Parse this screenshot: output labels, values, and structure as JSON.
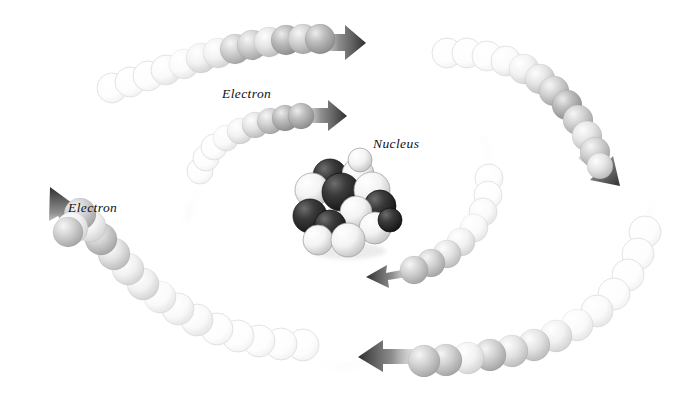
{
  "figure": {
    "background_color": "#ffffff",
    "width": 673,
    "height": 397
  },
  "labels": {
    "electron_outer_top": "Electron",
    "electron_outer_left": "Electron",
    "nucleus": "Nucleus"
  },
  "colors": {
    "background": "#ffffff",
    "arrow_dark": "#3a3a3a",
    "arrow_mid": "#6e6e6e",
    "sphere_dark": "#6a6a6a",
    "sphere_mid": "#a8a8a8",
    "sphere_light": "#e8e8e8",
    "sphere_faint": "#fbfbfb",
    "sphere_outline": "#cfcfcf",
    "proton_dark": "#2b2b2b",
    "neutron_light": "#f2f2f2",
    "wisp": "#e4e4e4",
    "text": "#111111"
  },
  "chart_data": {
    "type": "scatter",
    "xlabel": "",
    "ylabel": "",
    "xlim": [
      0,
      673
    ],
    "ylim": [
      0,
      397
    ],
    "grid": false,
    "legend": "none",
    "annotations": [
      {
        "text": "Electron",
        "x": 222,
        "y": 86,
        "style": "italic-serif"
      },
      {
        "text": "Electron",
        "x": 68,
        "y": 200,
        "style": "italic-serif"
      },
      {
        "text": "Nucleus",
        "x": 373,
        "y": 136,
        "style": "italic-serif"
      }
    ],
    "series": [
      {
        "name": "electron-trail-outer-top",
        "description": "Upper-left arc of spheres fading white-to-dark moving right",
        "arrow_direction": "right",
        "arrow_tip": [
          360,
          42
        ],
        "count": 13,
        "points": [
          {
            "x": 112,
            "y": 88,
            "r": 15,
            "shade": 0.03
          },
          {
            "x": 130,
            "y": 82,
            "r": 15,
            "shade": 0.04
          },
          {
            "x": 148,
            "y": 76,
            "r": 15,
            "shade": 0.05
          },
          {
            "x": 166,
            "y": 70,
            "r": 15,
            "shade": 0.08
          },
          {
            "x": 184,
            "y": 64,
            "r": 15,
            "shade": 0.13
          },
          {
            "x": 201,
            "y": 58,
            "r": 15,
            "shade": 0.22
          },
          {
            "x": 218,
            "y": 53,
            "r": 15,
            "shade": 0.35
          },
          {
            "x": 235,
            "y": 49,
            "r": 15,
            "shade": 0.5
          },
          {
            "x": 252,
            "y": 45,
            "r": 15,
            "shade": 0.62
          },
          {
            "x": 269,
            "y": 42,
            "r": 15,
            "shade": 0.45
          },
          {
            "x": 286,
            "y": 40,
            "r": 15,
            "shade": 0.7
          },
          {
            "x": 303,
            "y": 39,
            "r": 15,
            "shade": 0.55
          },
          {
            "x": 320,
            "y": 39,
            "r": 15,
            "shade": 0.74
          }
        ]
      },
      {
        "name": "electron-trail-inner",
        "description": "Inner small arc of spheres fading to dark moving right",
        "arrow_direction": "right",
        "arrow_tip": [
          343,
          114
        ],
        "count": 9,
        "points": [
          {
            "x": 200,
            "y": 171,
            "r": 13,
            "shade": 0.02
          },
          {
            "x": 206,
            "y": 158,
            "r": 13,
            "shade": 0.04
          },
          {
            "x": 214,
            "y": 147,
            "r": 13,
            "shade": 0.07
          },
          {
            "x": 226,
            "y": 138,
            "r": 13,
            "shade": 0.14
          },
          {
            "x": 240,
            "y": 131,
            "r": 13,
            "shade": 0.24
          },
          {
            "x": 255,
            "y": 125,
            "r": 13,
            "shade": 0.38
          },
          {
            "x": 270,
            "y": 121,
            "r": 13,
            "shade": 0.52
          },
          {
            "x": 285,
            "y": 118,
            "r": 13,
            "shade": 0.66
          },
          {
            "x": 301,
            "y": 116,
            "r": 13,
            "shade": 0.72
          }
        ]
      },
      {
        "name": "electron-trail-outer-right",
        "description": "Upper-right arc of spheres curving down, fading white-to-dark",
        "arrow_direction": "down-right",
        "arrow_tip": [
          637,
          190
        ],
        "count": 12,
        "points": [
          {
            "x": 447,
            "y": 53,
            "r": 15,
            "shade": 0.03
          },
          {
            "x": 467,
            "y": 53,
            "r": 15,
            "shade": 0.04
          },
          {
            "x": 487,
            "y": 56,
            "r": 15,
            "shade": 0.06
          },
          {
            "x": 506,
            "y": 61,
            "r": 15,
            "shade": 0.1
          },
          {
            "x": 524,
            "y": 69,
            "r": 15,
            "shade": 0.22
          },
          {
            "x": 540,
            "y": 79,
            "r": 15,
            "shade": 0.36
          },
          {
            "x": 554,
            "y": 91,
            "r": 15,
            "shade": 0.52
          },
          {
            "x": 567,
            "y": 105,
            "r": 15,
            "shade": 0.66
          },
          {
            "x": 578,
            "y": 120,
            "r": 15,
            "shade": 0.58
          },
          {
            "x": 587,
            "y": 136,
            "r": 15,
            "shade": 0.44
          },
          {
            "x": 595,
            "y": 152,
            "r": 15,
            "shade": 0.55
          },
          {
            "x": 600,
            "y": 166,
            "r": 13,
            "shade": 0.45
          }
        ]
      },
      {
        "name": "electron-trail-center-right",
        "description": "Short arc right of nucleus, sweeping left toward nucleus",
        "arrow_direction": "left",
        "arrow_tip": [
          375,
          276
        ],
        "count": 8,
        "points": [
          {
            "x": 489,
            "y": 178,
            "r": 14,
            "shade": 0.03
          },
          {
            "x": 488,
            "y": 195,
            "r": 14,
            "shade": 0.05
          },
          {
            "x": 483,
            "y": 212,
            "r": 14,
            "shade": 0.1
          },
          {
            "x": 474,
            "y": 228,
            "r": 14,
            "shade": 0.2
          },
          {
            "x": 461,
            "y": 242,
            "r": 14,
            "shade": 0.33
          },
          {
            "x": 447,
            "y": 254,
            "r": 14,
            "shade": 0.45
          },
          {
            "x": 431,
            "y": 263,
            "r": 14,
            "shade": 0.56
          },
          {
            "x": 414,
            "y": 270,
            "r": 14,
            "shade": 0.62
          }
        ]
      },
      {
        "name": "electron-trail-outer-bottom-right",
        "description": "Lower-right long arc sweeping left across the bottom",
        "arrow_direction": "left",
        "arrow_tip": [
          355,
          355
        ],
        "count": 13,
        "points": [
          {
            "x": 645,
            "y": 232,
            "r": 16,
            "shade": 0.03
          },
          {
            "x": 638,
            "y": 254,
            "r": 16,
            "shade": 0.04
          },
          {
            "x": 628,
            "y": 275,
            "r": 16,
            "shade": 0.05
          },
          {
            "x": 614,
            "y": 294,
            "r": 16,
            "shade": 0.07
          },
          {
            "x": 597,
            "y": 311,
            "r": 16,
            "shade": 0.1
          },
          {
            "x": 577,
            "y": 325,
            "r": 16,
            "shade": 0.18
          },
          {
            "x": 556,
            "y": 336,
            "r": 16,
            "shade": 0.3
          },
          {
            "x": 534,
            "y": 345,
            "r": 16,
            "shade": 0.44
          },
          {
            "x": 512,
            "y": 351,
            "r": 16,
            "shade": 0.36
          },
          {
            "x": 490,
            "y": 355,
            "r": 16,
            "shade": 0.6
          },
          {
            "x": 468,
            "y": 358,
            "r": 16,
            "shade": 0.3
          },
          {
            "x": 446,
            "y": 360,
            "r": 16,
            "shade": 0.52
          },
          {
            "x": 424,
            "y": 361,
            "r": 16,
            "shade": 0.55
          }
        ]
      },
      {
        "name": "electron-trail-outer-left",
        "description": "Lower-left long arc of spheres rising to an up arrow",
        "arrow_direction": "up",
        "arrow_tip": [
          52,
          192
        ],
        "count": 16,
        "points": [
          {
            "x": 303,
            "y": 345,
            "r": 16,
            "shade": 0.02
          },
          {
            "x": 281,
            "y": 344,
            "r": 16,
            "shade": 0.02
          },
          {
            "x": 259,
            "y": 341,
            "r": 16,
            "shade": 0.03
          },
          {
            "x": 238,
            "y": 336,
            "r": 16,
            "shade": 0.04
          },
          {
            "x": 217,
            "y": 329,
            "r": 16,
            "shade": 0.06
          },
          {
            "x": 197,
            "y": 320,
            "r": 16,
            "shade": 0.08
          },
          {
            "x": 178,
            "y": 309,
            "r": 16,
            "shade": 0.11
          },
          {
            "x": 160,
            "y": 297,
            "r": 16,
            "shade": 0.16
          },
          {
            "x": 143,
            "y": 284,
            "r": 16,
            "shade": 0.22
          },
          {
            "x": 128,
            "y": 269,
            "r": 16,
            "shade": 0.3
          },
          {
            "x": 114,
            "y": 254,
            "r": 16,
            "shade": 0.4
          },
          {
            "x": 101,
            "y": 239,
            "r": 16,
            "shade": 0.54
          },
          {
            "x": 90,
            "y": 226,
            "r": 16,
            "shade": 0.32
          },
          {
            "x": 80,
            "y": 214,
            "r": 16,
            "shade": 0.6
          },
          {
            "x": 72,
            "y": 228,
            "r": 16,
            "shade": 0.34
          },
          {
            "x": 68,
            "y": 232,
            "r": 15,
            "shade": 0.58
          }
        ]
      }
    ],
    "nucleus": {
      "name": "nucleus-cluster",
      "center": [
        344,
        207
      ],
      "radius": 46,
      "particle_count": 14,
      "particles": [
        {
          "x": 330,
          "y": 176,
          "r": 17,
          "type": "proton"
        },
        {
          "x": 358,
          "y": 174,
          "r": 16,
          "type": "neutron"
        },
        {
          "x": 312,
          "y": 190,
          "r": 17,
          "type": "neutron"
        },
        {
          "x": 341,
          "y": 192,
          "r": 19,
          "type": "proton"
        },
        {
          "x": 372,
          "y": 190,
          "r": 18,
          "type": "neutron"
        },
        {
          "x": 310,
          "y": 216,
          "r": 17,
          "type": "proton"
        },
        {
          "x": 380,
          "y": 206,
          "r": 16,
          "type": "proton"
        },
        {
          "x": 356,
          "y": 212,
          "r": 16,
          "type": "neutron"
        },
        {
          "x": 330,
          "y": 226,
          "r": 16,
          "type": "proton"
        },
        {
          "x": 375,
          "y": 228,
          "r": 16,
          "type": "neutron"
        },
        {
          "x": 318,
          "y": 240,
          "r": 15,
          "type": "neutron"
        },
        {
          "x": 348,
          "y": 240,
          "r": 17,
          "type": "neutron"
        },
        {
          "x": 360,
          "y": 160,
          "r": 12,
          "type": "neutron"
        },
        {
          "x": 390,
          "y": 220,
          "r": 12,
          "type": "proton"
        }
      ]
    }
  }
}
